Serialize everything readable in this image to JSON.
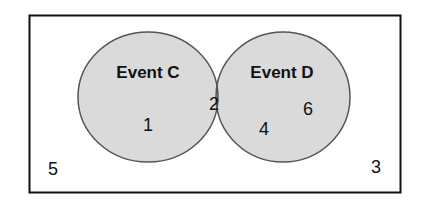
{
  "diagram": {
    "type": "venn",
    "sets": [
      {
        "name": "Event C",
        "only_value": "1"
      },
      {
        "name": "Event D",
        "only_values": [
          "6",
          "4"
        ]
      }
    ],
    "intersection_value": "2",
    "outside_values": [
      "5",
      "3"
    ],
    "colors": {
      "circle_fill": "#dadada",
      "intersection_fill": "#a9a9a9",
      "stroke": "#555555",
      "frame": "#111111"
    }
  }
}
